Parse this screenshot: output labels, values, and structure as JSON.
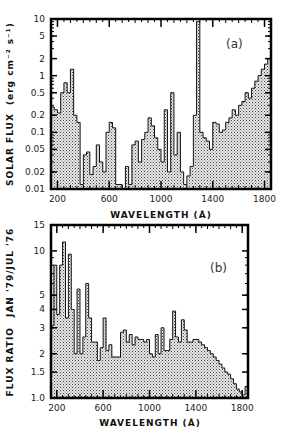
{
  "chart_data": [
    {
      "type": "bar",
      "panel_label": "(a)",
      "title": "",
      "xlabel": "WAVELENGTH (Å)",
      "ylabel": "SOLAR FLUX (erg cm⁻² s⁻¹)",
      "xlim": [
        150,
        1850
      ],
      "ylim": [
        0.01,
        10
      ],
      "yscale": "log",
      "xticks": [
        "200",
        "600",
        "1000",
        "1400",
        "1800"
      ],
      "yticks": [
        "10",
        "5",
        "2",
        "1",
        "0.5",
        "0.2",
        "0.1",
        "0.05",
        "0.02",
        "0.01"
      ],
      "grid": false,
      "style": "histogram (stippled fill)",
      "bin_edges": [
        150,
        175,
        200,
        225,
        250,
        275,
        300,
        325,
        350,
        375,
        400,
        425,
        450,
        475,
        500,
        525,
        550,
        575,
        600,
        625,
        650,
        675,
        700,
        725,
        750,
        775,
        800,
        825,
        850,
        875,
        900,
        925,
        950,
        975,
        1000,
        1025,
        1050,
        1075,
        1100,
        1125,
        1150,
        1175,
        1200,
        1225,
        1250,
        1275,
        1300,
        1325,
        1350,
        1375,
        1400,
        1425,
        1450,
        1475,
        1500,
        1525,
        1550,
        1575,
        1600,
        1625,
        1650,
        1675,
        1700,
        1725,
        1750,
        1775,
        1800,
        1825
      ],
      "values": [
        0.28,
        0.25,
        0.22,
        0.5,
        0.75,
        0.5,
        1.3,
        0.2,
        0.15,
        0.012,
        0.04,
        0.045,
        0.018,
        0.025,
        0.06,
        0.03,
        0.02,
        0.1,
        0.15,
        0.12,
        0.012,
        0.012,
        0.01,
        0.025,
        0.012,
        0.06,
        0.07,
        0.03,
        0.075,
        0.1,
        0.18,
        0.13,
        0.08,
        0.05,
        0.03,
        0.25,
        0.02,
        0.5,
        0.04,
        0.1,
        0.02,
        0.012,
        0.017,
        0.025,
        0.2,
        9.0,
        0.1,
        0.08,
        0.07,
        0.05,
        0.15,
        0.14,
        0.1,
        0.11,
        0.15,
        0.18,
        0.25,
        0.2,
        0.3,
        0.35,
        0.5,
        0.4,
        0.6,
        0.8,
        1.0,
        1.3,
        1.6,
        2.0
      ]
    },
    {
      "type": "bar",
      "panel_label": "(b)",
      "title": "",
      "xlabel": "WAVELENGTH (Å)",
      "ylabel": "FLUX RATIO JAN '79/JUL '76",
      "xlim": [
        150,
        1850
      ],
      "ylim": [
        1.0,
        15
      ],
      "yscale": "log",
      "xticks": [
        "200",
        "600",
        "1000",
        "1400",
        "1800"
      ],
      "yticks": [
        "15",
        "10",
        "5",
        "4",
        "3",
        "2",
        "1.5",
        "1.0"
      ],
      "grid": false,
      "style": "histogram (stippled fill)",
      "bin_edges": [
        150,
        175,
        200,
        225,
        250,
        275,
        300,
        325,
        350,
        375,
        400,
        425,
        450,
        475,
        500,
        525,
        550,
        575,
        600,
        625,
        650,
        675,
        700,
        725,
        750,
        775,
        800,
        825,
        850,
        875,
        900,
        925,
        950,
        975,
        1000,
        1025,
        1050,
        1075,
        1100,
        1125,
        1150,
        1175,
        1200,
        1225,
        1250,
        1275,
        1300,
        1325,
        1350,
        1375,
        1400,
        1425,
        1450,
        1475,
        1500,
        1525,
        1550,
        1575,
        1600,
        1625,
        1650,
        1675,
        1700,
        1725,
        1750,
        1775,
        1800,
        1825
      ],
      "values": [
        3.1,
        8.0,
        3.7,
        8.0,
        11.5,
        3.5,
        9.5,
        4.0,
        2.0,
        5.5,
        2.0,
        2.6,
        6.0,
        3.5,
        2.4,
        2.4,
        1.8,
        2.2,
        3.5,
        2.1,
        2.3,
        1.9,
        1.9,
        1.9,
        2.8,
        2.9,
        2.4,
        2.7,
        2.3,
        2.6,
        2.5,
        2.5,
        2.4,
        2.5,
        2.0,
        1.9,
        2.7,
        2.0,
        3.0,
        2.1,
        2.1,
        2.5,
        3.9,
        2.6,
        2.4,
        3.4,
        2.9,
        2.4,
        2.4,
        2.5,
        2.5,
        2.4,
        2.3,
        2.2,
        2.1,
        2.0,
        1.9,
        1.8,
        1.7,
        1.6,
        1.5,
        1.45,
        1.35,
        1.25,
        1.15,
        1.1,
        1.05,
        1.2
      ]
    }
  ],
  "panels": {
    "a": {
      "tag": "(a)",
      "xlabel": "WAVELENGTH (Å)",
      "ylabel_main": "SOLAR FLUX",
      "ylabel_units": "(erg cm⁻² s⁻¹)",
      "xticks": [
        "200",
        "600",
        "1000",
        "1400",
        "1800"
      ],
      "yticks": [
        "10",
        "5",
        "2",
        "1",
        "0.5",
        "0.2",
        "0.1",
        "0.05",
        "0.02",
        "0.01"
      ]
    },
    "b": {
      "tag": "(b)",
      "xlabel": "WAVELENGTH (Å)",
      "ylabel_main": "FLUX RATIO",
      "ylabel_units": "JAN '79/JUL '76",
      "xticks": [
        "200",
        "600",
        "1000",
        "1400",
        "1800"
      ],
      "yticks": [
        "15",
        "10",
        "5",
        "4",
        "3",
        "2",
        "1.5",
        "1.0"
      ]
    }
  }
}
